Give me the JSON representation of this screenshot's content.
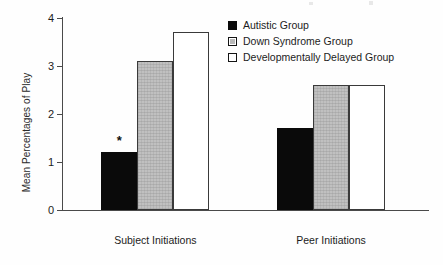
{
  "chart_data": {
    "type": "bar",
    "title": "",
    "xlabel": "",
    "ylabel": "Mean Percentages of Play",
    "ylim": [
      0,
      4
    ],
    "yticks": [
      "0",
      "1",
      "2",
      "3",
      "4"
    ],
    "grid": false,
    "legend_position": "top-right",
    "categories": [
      "Subject Initiations",
      "Peer Initiations"
    ],
    "series": [
      {
        "name": "Autistic Group",
        "color": "#0a0a0a",
        "fill": "solid-black",
        "values": [
          1.2,
          1.7
        ]
      },
      {
        "name": "Down Syndrome Group",
        "color": "#c0c0c0",
        "fill": "gray-stipple",
        "values": [
          3.1,
          2.6
        ]
      },
      {
        "name": "Developmentally Delayed Group",
        "color": "#ffffff",
        "fill": "white-outline",
        "values": [
          3.7,
          2.6
        ]
      }
    ],
    "annotations": [
      {
        "text": "*",
        "series": "Autistic Group",
        "category": "Subject Initiations",
        "value": 1.2
      }
    ]
  }
}
